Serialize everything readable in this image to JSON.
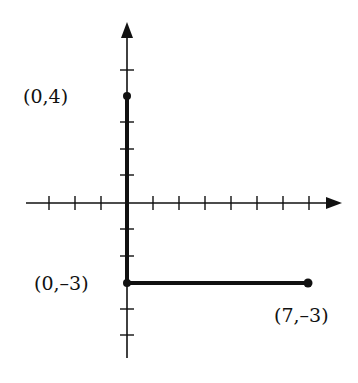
{
  "diagram": {
    "type": "coordinate-plane",
    "origin_px": {
      "x": 127,
      "y": 203
    },
    "unit_px": 26,
    "x_axis": {
      "min_tick": -3,
      "max_tick": 7,
      "arrow": "right"
    },
    "y_axis": {
      "min_tick": -5,
      "max_tick": 5,
      "arrow": "up"
    },
    "points": [
      {
        "id": "p1",
        "x": 0,
        "y": 4,
        "label": "(0,4)"
      },
      {
        "id": "p2",
        "x": 0,
        "y": -3,
        "label": "(0,–3)"
      },
      {
        "id": "p3",
        "x": 7,
        "y": -3,
        "label": "(7,–3)"
      }
    ],
    "segments": [
      {
        "from": "p1",
        "to": "p2"
      },
      {
        "from": "p2",
        "to": "p3"
      }
    ],
    "colors": {
      "axis": "#111111",
      "segment": "#111111",
      "background": "#ffffff"
    }
  }
}
